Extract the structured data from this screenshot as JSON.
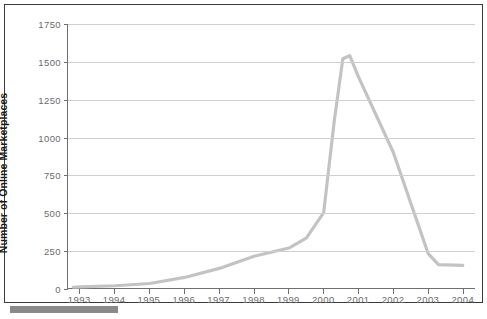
{
  "chart_data": {
    "type": "line",
    "title": "",
    "xlabel": "",
    "ylabel": "Number of Online Marketplaces",
    "xlim": [
      1992.65,
      1904.0
    ],
    "ylim": [
      0,
      1750
    ],
    "ytick_values": [
      0,
      250,
      500,
      750,
      1000,
      1250,
      1500,
      1750
    ],
    "ytick_labels": [
      "0",
      "250",
      "500",
      "750",
      "1000",
      "1250",
      "1500",
      "1750"
    ],
    "xtick_values": [
      1993,
      1994,
      1995,
      1996,
      1997,
      1998,
      1999,
      2000,
      2001,
      2002,
      2003,
      2004
    ],
    "xtick_labels": [
      "1993",
      "1994",
      "1995",
      "1996",
      "1997",
      "1998",
      "1999",
      "2000",
      "2001",
      "2002",
      "2003",
      "2004"
    ],
    "grid": true,
    "legend": false,
    "series": [
      {
        "name": "Online Marketplaces",
        "color": "#c3c3c3",
        "x": [
          1992.8,
          1993,
          1994,
          1995,
          1996,
          1997,
          1998,
          1999,
          1999.5,
          2000,
          2000.3,
          2000.55,
          2000.75,
          2001,
          2002,
          2003,
          2003.3,
          2004
        ],
        "values": [
          5,
          8,
          15,
          30,
          70,
          130,
          210,
          265,
          330,
          500,
          1100,
          1520,
          1540,
          1400,
          900,
          230,
          155,
          150
        ]
      }
    ]
  },
  "axes": {
    "line_color": "#c3c3c3",
    "grid_color": "#cfcfcf",
    "axis_color": "#6f6f6f",
    "frame_color": "#3a3a3a",
    "tick_text_color": "#6b6b6b",
    "label_text_color": "#1a1a1a"
  }
}
